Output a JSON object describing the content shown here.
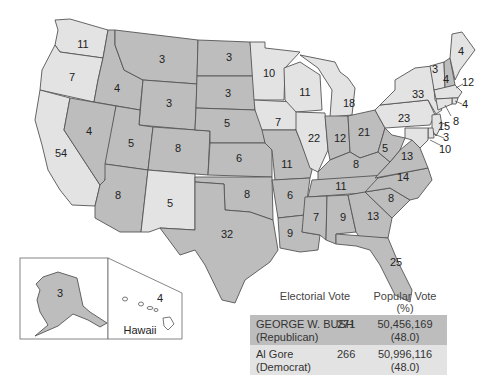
{
  "map": {
    "colors": {
      "republican": "#bdbdbd",
      "democrat": "#e3e3e3",
      "border": "#555555"
    },
    "states": [
      {
        "id": "WA",
        "votes": "11",
        "party": "D"
      },
      {
        "id": "OR",
        "votes": "7",
        "party": "D"
      },
      {
        "id": "CA",
        "votes": "54",
        "party": "D"
      },
      {
        "id": "ID",
        "votes": "4",
        "party": "R"
      },
      {
        "id": "NV",
        "votes": "4",
        "party": "R"
      },
      {
        "id": "MT",
        "votes": "3",
        "party": "R"
      },
      {
        "id": "WY",
        "votes": "3",
        "party": "R"
      },
      {
        "id": "UT",
        "votes": "5",
        "party": "R"
      },
      {
        "id": "CO",
        "votes": "8",
        "party": "R"
      },
      {
        "id": "AZ",
        "votes": "8",
        "party": "R"
      },
      {
        "id": "NM",
        "votes": "5",
        "party": "D"
      },
      {
        "id": "ND",
        "votes": "3",
        "party": "R"
      },
      {
        "id": "SD",
        "votes": "3",
        "party": "R"
      },
      {
        "id": "NE",
        "votes": "5",
        "party": "R"
      },
      {
        "id": "KS",
        "votes": "6",
        "party": "R"
      },
      {
        "id": "OK",
        "votes": "8",
        "party": "R"
      },
      {
        "id": "TX",
        "votes": "32",
        "party": "R"
      },
      {
        "id": "MN",
        "votes": "10",
        "party": "D"
      },
      {
        "id": "IA",
        "votes": "7",
        "party": "D"
      },
      {
        "id": "MO",
        "votes": "11",
        "party": "R"
      },
      {
        "id": "AR",
        "votes": "6",
        "party": "R"
      },
      {
        "id": "LA",
        "votes": "9",
        "party": "R"
      },
      {
        "id": "WI",
        "votes": "11",
        "party": "D"
      },
      {
        "id": "IL",
        "votes": "22",
        "party": "D"
      },
      {
        "id": "MI",
        "votes": "18",
        "party": "D"
      },
      {
        "id": "IN",
        "votes": "12",
        "party": "R"
      },
      {
        "id": "OH",
        "votes": "21",
        "party": "R"
      },
      {
        "id": "KY",
        "votes": "8",
        "party": "R"
      },
      {
        "id": "TN",
        "votes": "11",
        "party": "R"
      },
      {
        "id": "MS",
        "votes": "7",
        "party": "R"
      },
      {
        "id": "AL",
        "votes": "9",
        "party": "R"
      },
      {
        "id": "GA",
        "votes": "13",
        "party": "R"
      },
      {
        "id": "FL",
        "votes": "25",
        "party": "R"
      },
      {
        "id": "SC",
        "votes": "8",
        "party": "R"
      },
      {
        "id": "NC",
        "votes": "14",
        "party": "R"
      },
      {
        "id": "VA",
        "votes": "13",
        "party": "R"
      },
      {
        "id": "WV",
        "votes": "5",
        "party": "R"
      },
      {
        "id": "PA",
        "votes": "23",
        "party": "D"
      },
      {
        "id": "NY",
        "votes": "33",
        "party": "D"
      },
      {
        "id": "VT",
        "votes": "3",
        "party": "D"
      },
      {
        "id": "NH",
        "votes": "4",
        "party": "R"
      },
      {
        "id": "ME",
        "votes": "4",
        "party": "D"
      },
      {
        "id": "MA",
        "votes": "12",
        "party": "D"
      },
      {
        "id": "RI",
        "votes": "4",
        "party": "D"
      },
      {
        "id": "CT",
        "votes": "8",
        "party": "D"
      },
      {
        "id": "NJ",
        "votes": "15",
        "party": "D"
      },
      {
        "id": "DE",
        "votes": "3",
        "party": "D"
      },
      {
        "id": "MD",
        "votes": "10",
        "party": "D"
      },
      {
        "id": "AK",
        "votes": "3",
        "party": "R"
      },
      {
        "id": "HI",
        "votes": "4",
        "party": "D"
      }
    ],
    "hawaii_label": "Hawaii"
  },
  "legend": {
    "headers": {
      "electoral": "Electorial Vote",
      "popular_line1": "Popular Vote",
      "popular_line2": "(%)"
    },
    "rows": [
      {
        "name": "GEORGE W. BUSH",
        "party": "(Republican)",
        "electoral": "271",
        "popular": "50,456,169",
        "percent": "(48.0)",
        "color": "#bdbdbd"
      },
      {
        "name": "Al Gore",
        "party": "(Democrat)",
        "electoral": "266",
        "popular": "50,996,116",
        "percent": "(48.0)",
        "color": "#e3e3e3"
      }
    ]
  }
}
